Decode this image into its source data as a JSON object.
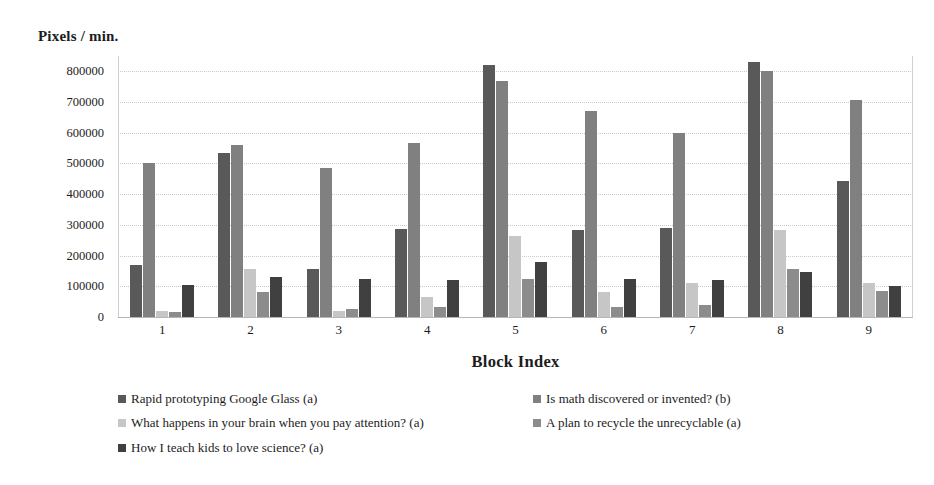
{
  "chart_data": {
    "type": "bar",
    "title": "",
    "ylabel": "Pixels / min.",
    "xlabel": "Block Index",
    "categories": [
      "1",
      "2",
      "3",
      "4",
      "5",
      "6",
      "7",
      "8",
      "9"
    ],
    "ylim": [
      0,
      850000
    ],
    "ytick_values": [
      0,
      100000,
      200000,
      300000,
      400000,
      500000,
      600000,
      700000,
      800000
    ],
    "ytick_labels": [
      "0",
      "100000",
      "200000",
      "300000",
      "400000",
      "500000",
      "600000",
      "700000",
      "800000"
    ],
    "grid": true,
    "legend_position": "bottom",
    "series": [
      {
        "name": "Rapid prototyping Google Glass (a)",
        "color": "#595959",
        "values": [
          168000,
          533000,
          157000,
          287000,
          820000,
          285000,
          290000,
          832000,
          443000
        ]
      },
      {
        "name": "Is math discovered or invented? (b)",
        "color": "#808080",
        "values": [
          503000,
          560000,
          485000,
          568000,
          770000,
          672000,
          600000,
          800000,
          707000
        ]
      },
      {
        "name": "What happens in your brain when you pay attention? (a)",
        "color": "#c6c6c6",
        "values": [
          20000,
          158000,
          20000,
          65000,
          265000,
          80000,
          110000,
          285000,
          110000
        ]
      },
      {
        "name": "A plan to recycle the unrecyclable (a)",
        "color": "#8c8c8c",
        "values": [
          16000,
          82000,
          25000,
          31000,
          125000,
          31000,
          40000,
          157000,
          85000
        ]
      },
      {
        "name": "How I teach kids to love science? (a)",
        "color": "#404040",
        "values": [
          105000,
          130000,
          124000,
          121000,
          178000,
          124000,
          120000,
          145000,
          100000
        ]
      }
    ]
  }
}
